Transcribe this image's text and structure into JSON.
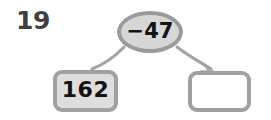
{
  "worksheet": {
    "question_number": "19",
    "diagram_type": "function-machine",
    "operation": {
      "label": "−47",
      "fill_color": "#d7d7d7",
      "border_color": "#9a9a9a"
    },
    "input": {
      "label": "162",
      "fill_color": "#dedede",
      "border_color": "#a0a0a0"
    },
    "answer": {
      "label": "",
      "fill_color": "#ffffff",
      "border_color": "#a0a0a0"
    },
    "arrows": {
      "left_label": "arrow-from-input-to-operation",
      "right_label": "arrow-from-operation-to-answer",
      "color": "#a3a3a3"
    },
    "background_color": "#ffffff"
  }
}
